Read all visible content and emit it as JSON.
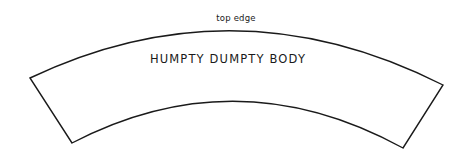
{
  "canvas": {
    "width": 468,
    "height": 159,
    "background_color": "#ffffff",
    "line_color": "#1a1a1a",
    "line_width": 1.4
  },
  "pattern_piece": {
    "name": "humpty-dumpty-body-pattern-piece",
    "shape": "annular-sector",
    "labels": {
      "top_edge": "top edge",
      "piece_name": "HUMPTY DUMPTY BODY"
    },
    "geometry": {
      "outer_arc": {
        "start": [
          30,
          78
        ],
        "apex": [
          235,
          11
        ],
        "end": [
          443,
          85
        ]
      },
      "inner_arc": {
        "start": [
          72,
          143
        ],
        "apex": [
          237,
          95
        ],
        "end": [
          403,
          148
        ]
      },
      "left_edge": {
        "start": [
          30,
          78
        ],
        "end": [
          72,
          143
        ]
      },
      "right_edge": {
        "start": [
          443,
          85
        ],
        "end": [
          403,
          148
        ]
      },
      "path": "M 30 78 Q 236 -20 443 85 L 403 148 Q 237 57 72 143 Z"
    }
  }
}
